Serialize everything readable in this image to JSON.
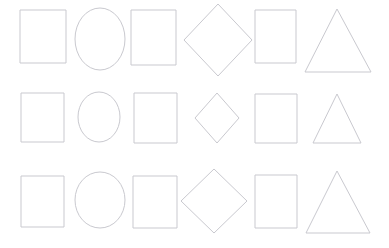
{
  "canvas": {
    "width": 389,
    "height": 248,
    "background_color": "#ffffff",
    "stroke_color": "#c9c9cf",
    "stroke_width": 1,
    "fill": "none",
    "description": "Grid of outlined geometric shapes, 3 rows by 6 columns"
  },
  "grid": {
    "rows": 3,
    "columns": 6,
    "column_shape_names": [
      "square",
      "ellipse",
      "rectangle",
      "diamond",
      "square",
      "triangle"
    ]
  },
  "rows": [
    {
      "row_label": "row-1",
      "shapes": [
        {
          "name": "square",
          "x": 20,
          "y": 10,
          "width": 46,
          "height": 53,
          "cx": 43,
          "cy": 36
        },
        {
          "name": "ellipse",
          "cx": 100,
          "cy": 39,
          "rx": 25,
          "ry": 31
        },
        {
          "name": "rectangle",
          "x": 131,
          "y": 10,
          "width": 45,
          "height": 55,
          "cx": 153,
          "cy": 37
        },
        {
          "name": "diamond",
          "cx": 218,
          "cy": 40,
          "rx": 34,
          "ry": 36
        },
        {
          "name": "square",
          "x": 255,
          "y": 10,
          "width": 41,
          "height": 53,
          "cx": 275,
          "cy": 36
        },
        {
          "name": "triangle",
          "apex_x": 337,
          "apex_y": 9,
          "base_left_x": 305,
          "base_right_x": 371,
          "base_y": 72
        }
      ]
    },
    {
      "row_label": "row-2",
      "shapes": [
        {
          "name": "square",
          "x": 21,
          "y": 93,
          "width": 43,
          "height": 49,
          "cx": 42,
          "cy": 117
        },
        {
          "name": "ellipse",
          "cx": 99,
          "cy": 117,
          "rx": 21,
          "ry": 25
        },
        {
          "name": "rectangle",
          "x": 134,
          "y": 93,
          "width": 43,
          "height": 50,
          "cx": 155,
          "cy": 118
        },
        {
          "name": "diamond",
          "cx": 217,
          "cy": 118,
          "rx": 22,
          "ry": 25
        },
        {
          "name": "square",
          "x": 255,
          "y": 94,
          "width": 42,
          "height": 49,
          "cx": 276,
          "cy": 118
        },
        {
          "name": "triangle",
          "apex_x": 337,
          "apex_y": 94,
          "base_left_x": 313,
          "base_right_x": 361,
          "base_y": 143
        }
      ]
    },
    {
      "row_label": "row-3",
      "shapes": [
        {
          "name": "square",
          "x": 21,
          "y": 176,
          "width": 43,
          "height": 51,
          "cx": 42,
          "cy": 201
        },
        {
          "name": "ellipse",
          "cx": 100,
          "cy": 200,
          "rx": 25,
          "ry": 28
        },
        {
          "name": "rectangle",
          "x": 133,
          "y": 176,
          "width": 44,
          "height": 52,
          "cx": 155,
          "cy": 202
        },
        {
          "name": "diamond",
          "cx": 214,
          "cy": 201,
          "rx": 33,
          "ry": 32
        },
        {
          "name": "square",
          "x": 255,
          "y": 175,
          "width": 42,
          "height": 53,
          "cx": 276,
          "cy": 201
        },
        {
          "name": "triangle",
          "apex_x": 337,
          "apex_y": 171,
          "base_left_x": 306,
          "base_right_x": 370,
          "base_y": 233
        }
      ]
    }
  ]
}
